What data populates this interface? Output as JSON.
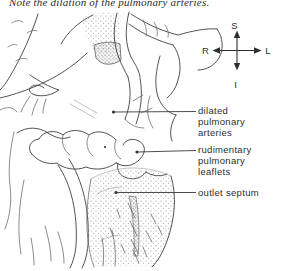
{
  "caption": "Note the dilation of the pulmonary arteries.",
  "compass": {
    "superior": "S",
    "inferior": "I",
    "left": "L",
    "right": "R"
  },
  "annotations": {
    "dilated": {
      "line1": "dilated",
      "line2": "pulmonary",
      "line3": "arteries"
    },
    "rudimentary": {
      "line1": "rudimentary",
      "line2": "pulmonary",
      "line3": "leaflets"
    },
    "outlet": {
      "line1": "outlet septum"
    }
  },
  "colors": {
    "ink": "#3f3f3f",
    "label_text": "#2e2e2e",
    "stipple_light": "#8c8c8c",
    "stipple_dense": "#5e5e5e",
    "background": "#ffffff"
  }
}
